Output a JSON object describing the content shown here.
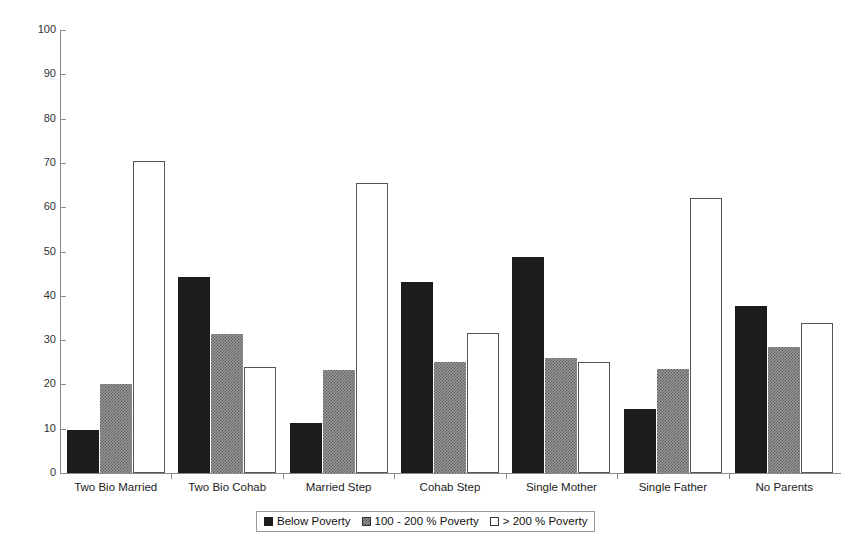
{
  "chart_data": {
    "type": "bar",
    "title": "",
    "xlabel": "",
    "ylabel": "",
    "ylim": [
      0,
      100
    ],
    "ytick_step": 10,
    "yticks": [
      "0",
      "10",
      "20",
      "30",
      "40",
      "50",
      "60",
      "70",
      "80",
      "90",
      "100"
    ],
    "grid": false,
    "legend_position": "bottom-center",
    "categories": [
      "Two Bio Married",
      "Two Bio Cohab",
      "Married  Step",
      "Cohab  Step",
      "Single Mother",
      "Single Father",
      "No Parents"
    ],
    "series": [
      {
        "name": "Below Poverty",
        "color": "#1c1c1c",
        "fill": "solid-black",
        "values": [
          9.6,
          44.3,
          11.3,
          43.2,
          48.7,
          14.5,
          37.6
        ]
      },
      {
        "name": "100 - 200 % Poverty",
        "color": "#9a9a9a",
        "fill": "checkered-gray",
        "values": [
          20.1,
          31.3,
          23.3,
          25.1,
          26.0,
          23.5,
          28.4
        ]
      },
      {
        "name": "> 200 % Poverty",
        "color": "#ffffff",
        "fill": "white-outline",
        "values": [
          70.4,
          24.0,
          65.4,
          31.5,
          25.1,
          62.1,
          33.8
        ]
      }
    ]
  },
  "legend": {
    "items": [
      {
        "label": "Below Poverty",
        "swatch": "solid-black-swatch"
      },
      {
        "label": "100 - 200 % Poverty",
        "swatch": "checkered-gray-swatch"
      },
      {
        "label": "> 200 % Poverty",
        "swatch": "white-outline-swatch"
      }
    ]
  }
}
